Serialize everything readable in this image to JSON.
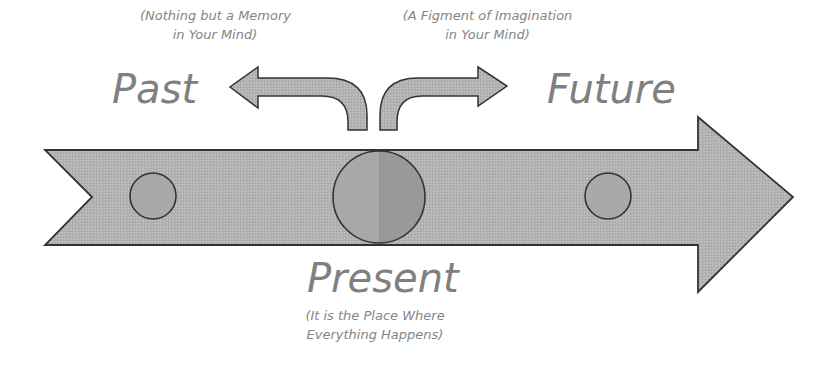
{
  "diagram": {
    "colors": {
      "fill": "#b3b3b3",
      "fill_dark": "#a6a6a6",
      "stroke": "#333333",
      "text": "#808080"
    },
    "past": {
      "label": "Past",
      "note_line1": "(Nothing but a Memory",
      "note_line2": "in Your Mind)"
    },
    "future": {
      "label": "Future",
      "note_line1": "(A Figment of Imagination",
      "note_line2": "in Your Mind)"
    },
    "present": {
      "label": "Present",
      "note_line1": "(It is the Place Where",
      "note_line2": "Everything Happens)"
    }
  }
}
